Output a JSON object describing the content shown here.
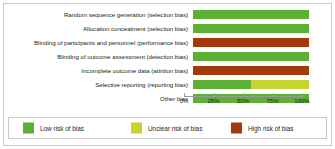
{
  "figure": {
    "background_color": "#ffffff",
    "frame_color": "#c9c9c9"
  },
  "chart_data": {
    "type": "bar",
    "orientation": "horizontal",
    "stacked": true,
    "normalized_percent": true,
    "title": "",
    "xlabel": "",
    "ylabel": "",
    "xlim": [
      0,
      100
    ],
    "grid": false,
    "legend_position": "bottom",
    "categories": [
      "Random sequence generation (selection bias)",
      "Allocation concealment (selection bias)",
      "Blinding of participants and personnel (performance bias)",
      "Blinding of outcome assessment (detection bias)",
      "Incomplete outcome data (attrition bias)",
      "Selective reporting (reporting bias)",
      "Other bias"
    ],
    "series": [
      {
        "name": "Low risk of bias",
        "color": "#5cb033",
        "values": [
          100,
          100,
          0,
          100,
          0,
          50,
          100
        ]
      },
      {
        "name": "Unclear risk of bias",
        "color": "#c7d430",
        "values": [
          0,
          0,
          0,
          0,
          0,
          50,
          0
        ]
      },
      {
        "name": "High risk of bias",
        "color": "#a43a0b",
        "values": [
          0,
          0,
          100,
          0,
          100,
          0,
          0
        ]
      }
    ],
    "xticks": [
      0,
      25,
      50,
      75,
      100
    ],
    "xtick_labels": [
      "0%",
      "25%",
      "50%",
      "75%",
      "100%"
    ]
  },
  "axis": {
    "ticks": [
      {
        "label": "0%",
        "value": 0
      },
      {
        "label": "25%",
        "value": 25
      },
      {
        "label": "50%",
        "value": 50
      },
      {
        "label": "75%",
        "value": 75
      },
      {
        "label": "100%",
        "value": 100
      }
    ]
  },
  "legend": {
    "items": [
      {
        "label": "Low risk of bias",
        "color": "#5cb033",
        "swatch": "low-risk-swatch"
      },
      {
        "label": "Unclear risk of bias",
        "color": "#c7d430",
        "swatch": "unclear-risk-swatch"
      },
      {
        "label": "High risk of bias",
        "color": "#a43a0b",
        "swatch": "high-risk-swatch"
      }
    ]
  }
}
